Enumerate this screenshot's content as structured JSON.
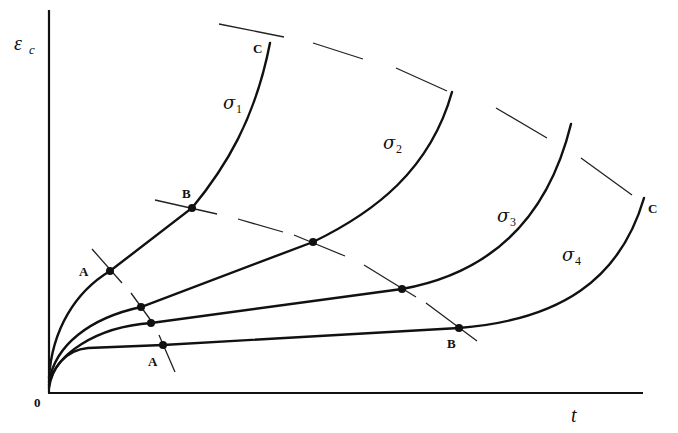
{
  "diagram": {
    "type": "creep-curves",
    "axes": {
      "y_label": "ε",
      "y_label_sub": "c",
      "x_label": "t",
      "origin_label": "0"
    },
    "curves": [
      {
        "id": "sigma1",
        "symbol": "σ",
        "subscript": "1"
      },
      {
        "id": "sigma2",
        "symbol": "σ",
        "subscript": "2"
      },
      {
        "id": "sigma3",
        "symbol": "σ",
        "subscript": "3"
      },
      {
        "id": "sigma4",
        "symbol": "σ",
        "subscript": "4"
      }
    ],
    "point_labels": {
      "A_upper": "A",
      "A_lower": "A",
      "B_upper": "B",
      "B_lower": "B",
      "C_upper": "C",
      "C_lower": "C"
    },
    "stress_order": "σ1 > σ2 > σ3 > σ4",
    "loci": [
      {
        "name": "A",
        "meaning": "end of primary creep"
      },
      {
        "name": "B",
        "meaning": "end of secondary creep"
      },
      {
        "name": "C",
        "meaning": "rupture"
      }
    ]
  }
}
